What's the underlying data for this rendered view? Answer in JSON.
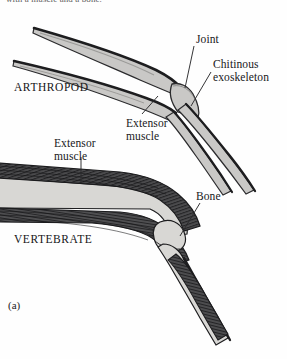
{
  "figure": {
    "panel_letter": "(a)",
    "clipped_top_caption": "with a muscle and a bone.",
    "background_color": "#fefefe",
    "ink_color": "#1a1a1a"
  },
  "labels": {
    "joint": "Joint",
    "chitinous_exoskeleton_line1": "Chitinous",
    "chitinous_exoskeleton_line2": "exoskeleton",
    "extensor_muscle_arthropod_line1": "Extensor",
    "extensor_muscle_arthropod_line2": "muscle",
    "extensor_muscle_vertebrate_line1": "Extensor",
    "extensor_muscle_vertebrate_line2": "muscle",
    "bone": "Bone"
  },
  "organisms": {
    "arthropod": "ARTHROPOD",
    "vertebrate": "VERTEBRATE"
  },
  "colors": {
    "exoskeleton_fill": "#c9c8c6",
    "exoskeleton_outline": "#2e2e30",
    "bone_fill": "#d8d7d4",
    "bone_outline": "#1d1d1f",
    "muscle_dark": "#3a3a3c",
    "muscle_mid": "#565658",
    "leader_line": "#2a2a2c"
  }
}
